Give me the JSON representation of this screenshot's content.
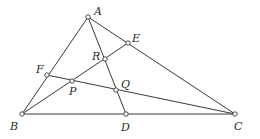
{
  "diagram": {
    "title": "",
    "points": {
      "A": {
        "label": "A",
        "x": 88,
        "y": 17
      },
      "B": {
        "label": "B",
        "x": 22,
        "y": 114
      },
      "C": {
        "label": "C",
        "x": 235,
        "y": 114
      },
      "D": {
        "label": "D",
        "x": 126,
        "y": 114
      },
      "E": {
        "label": "E",
        "x": 128,
        "y": 43
      },
      "F": {
        "label": "F",
        "x": 47,
        "y": 75
      },
      "P": {
        "label": "P",
        "x": 72,
        "y": 81
      },
      "Q": {
        "label": "Q",
        "x": 116,
        "y": 90
      },
      "R": {
        "label": "R",
        "x": 105,
        "y": 59
      }
    },
    "segments": [
      [
        "A",
        "B"
      ],
      [
        "A",
        "C"
      ],
      [
        "B",
        "C"
      ],
      [
        "A",
        "D"
      ],
      [
        "B",
        "E"
      ],
      [
        "F",
        "C"
      ]
    ],
    "colors": {
      "line": "#3a3a3a",
      "label": "#2a2a2a",
      "point_fill": "#ffffff"
    }
  }
}
